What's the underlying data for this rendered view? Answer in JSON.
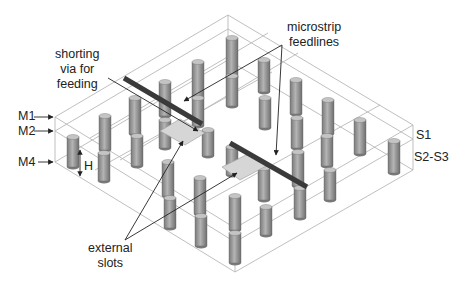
{
  "figure": {
    "type": "isometric 3D structure view",
    "colors": {
      "background": "#ffffff",
      "box_lines": "#b5b5b5",
      "pillar_fill": "#9a9a9a",
      "pillar_dark": "#6f6f6f",
      "feedline": "#3a3a3a",
      "slot_fill": "#d6d6d6",
      "annotation": "#222222"
    }
  },
  "labels": {
    "shorting_via": [
      "shorting",
      "via for",
      "feeding"
    ],
    "microstrip": [
      "microstrip",
      "feedlines"
    ],
    "m1": "M1",
    "m2": "M2",
    "m4": "M4",
    "height": "H",
    "s1": "S1",
    "s2_s3": "S2-S3",
    "external_slots": [
      "external",
      "slots"
    ]
  },
  "components": {
    "metal_layers": [
      "M1",
      "M2",
      "M4"
    ],
    "substrates": [
      "S1",
      "S2-S3"
    ],
    "feedline_count": 2,
    "slot_count": 2
  }
}
